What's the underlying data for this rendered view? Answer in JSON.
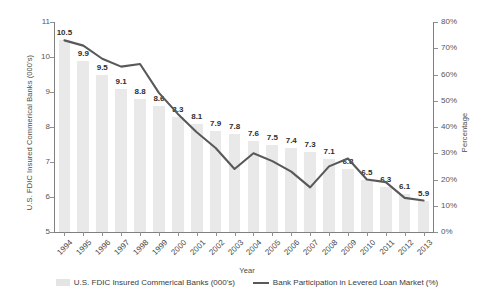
{
  "chart_data": {
    "type": "bar",
    "title": "",
    "xlabel": "Year",
    "categories": [
      "1994",
      "1995",
      "1996",
      "1997",
      "1998",
      "1999",
      "2000",
      "2001",
      "2002",
      "2003",
      "2004",
      "2005",
      "2006",
      "2007",
      "2008",
      "2009",
      "2010",
      "2011",
      "2012",
      "2013"
    ],
    "series": [
      {
        "name": "U.S. FDIC Insured Commerical Banks (000's)",
        "type": "bar",
        "axis": "left",
        "ylabel": "U.S. FDIC Insured Commerical Banks (000's)",
        "ylim": [
          5,
          11
        ],
        "yticks": [
          5,
          6,
          7,
          8,
          9,
          10,
          11
        ],
        "values": [
          10.5,
          9.9,
          9.5,
          9.1,
          8.8,
          8.6,
          8.3,
          8.1,
          7.9,
          7.8,
          7.6,
          7.5,
          7.4,
          7.3,
          7.1,
          6.8,
          6.5,
          6.3,
          6.1,
          5.9
        ],
        "data_labels": [
          "10.5",
          "9.9",
          "9.5",
          "9.1",
          "8.8",
          "8.6",
          "8.3",
          "8.1",
          "7.9",
          "7.8",
          "7.6",
          "7.5",
          "7.4",
          "7.3",
          "7.1",
          "6.8",
          "6.5",
          "6.3",
          "6.1",
          "5.9"
        ],
        "color": "#e9e9e9"
      },
      {
        "name": "Bank Participation in Levered Loan Market (%)",
        "type": "line",
        "axis": "right",
        "ylabel": "Percentage",
        "ylim": [
          0,
          80
        ],
        "yticks": [
          0,
          10,
          20,
          30,
          40,
          50,
          60,
          70,
          80
        ],
        "ytick_labels": [
          "0%",
          "10%",
          "20%",
          "30%",
          "40%",
          "50%",
          "60%",
          "70%",
          "80%"
        ],
        "values": [
          73,
          71,
          66,
          63,
          64,
          53,
          45,
          38,
          32,
          24,
          30,
          27,
          23,
          17,
          25,
          28,
          20,
          19,
          13,
          12
        ],
        "color": "#595959"
      }
    ],
    "legend_position": "bottom",
    "grid": false
  },
  "legend": {
    "bar_label": "U.S. FDIC Insured Commerical Banks (000's)",
    "line_label": "Bank Participation in Levered Loan Market (%)"
  },
  "axes": {
    "left_title": "U.S. FDIC Insured Commerical Banks (000's)",
    "right_title": "Percentage",
    "x_title": "Year"
  }
}
